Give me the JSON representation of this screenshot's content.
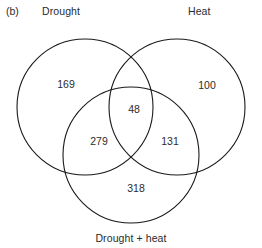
{
  "figure": {
    "panel_label": "(b)",
    "type": "venn-diagram-3set",
    "stroke_color": "#1a1a1a",
    "text_color": "#2b2b2b",
    "fill_color": "#ffffff",
    "background_color": "#ffffff"
  },
  "sets": [
    {
      "id": "drought",
      "label": "Drought",
      "cx": 85,
      "cy": 107,
      "r": 68
    },
    {
      "id": "heat",
      "label": "Heat",
      "cx": 177,
      "cy": 107,
      "r": 68
    },
    {
      "id": "drought_heat",
      "label": "Drought + heat",
      "cx": 131,
      "cy": 155,
      "r": 68
    }
  ],
  "regions": [
    {
      "id": "drought_only",
      "value": "169",
      "x": 66,
      "y": 84
    },
    {
      "id": "heat_only",
      "value": "100",
      "x": 207,
      "y": 85
    },
    {
      "id": "drought_and_heat",
      "value": "48",
      "x": 134,
      "y": 109
    },
    {
      "id": "drought_and_droughtheat",
      "value": "279",
      "x": 99,
      "y": 141
    },
    {
      "id": "heat_and_droughtheat",
      "value": "131",
      "x": 170,
      "y": 141
    },
    {
      "id": "drought_heat_only",
      "value": "318",
      "x": 136,
      "y": 188
    }
  ],
  "chart_data": {
    "type": "venn",
    "title": "",
    "panel": "(b)",
    "set_labels": [
      "Drought",
      "Heat",
      "Drought + heat"
    ],
    "region_labels": [
      "Drought only",
      "Heat only",
      "Drought ∩ Heat",
      "Drought ∩ Drought + heat",
      "Heat ∩ Drought + heat",
      "Drought + heat only"
    ],
    "values": [
      169,
      100,
      48,
      279,
      131,
      318
    ],
    "counts": {
      "drought_only": 169,
      "heat_only": 100,
      "drought_heat_overlap": 48,
      "drought_droughtheat_overlap": 279,
      "heat_droughtheat_overlap": 131,
      "droughtheat_only": 318
    },
    "total": 1045,
    "legend": "none",
    "grid": false,
    "xlabel": "",
    "ylabel": ""
  }
}
